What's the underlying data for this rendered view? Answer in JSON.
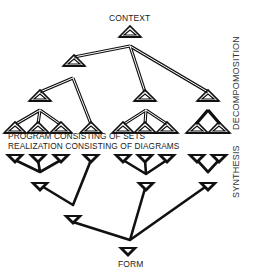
{
  "diagram": {
    "top_label": "CONTEXT",
    "bottom_label": "FORM",
    "middle_labels": {
      "program": "PROGRAM  CONSISTING  OF SETS",
      "realization": "REALIZATION  CONSISTING OF DIAGRAMS"
    },
    "side_labels": {
      "decomposition": "DECOMPOMOSITION",
      "synthesis": "SYNTHESIS"
    },
    "colors": {
      "ink": "#111111",
      "background": "#ffffff"
    },
    "decomposition_tree": {
      "node_shape": "outlined-up-triangle",
      "levels": 4,
      "leaf_groups": [
        3,
        1,
        3,
        2
      ]
    },
    "synthesis_tree": {
      "node_shape": "solid-down-triangle",
      "levels": 4,
      "leaf_groups": [
        3,
        1,
        3,
        2
      ]
    }
  }
}
